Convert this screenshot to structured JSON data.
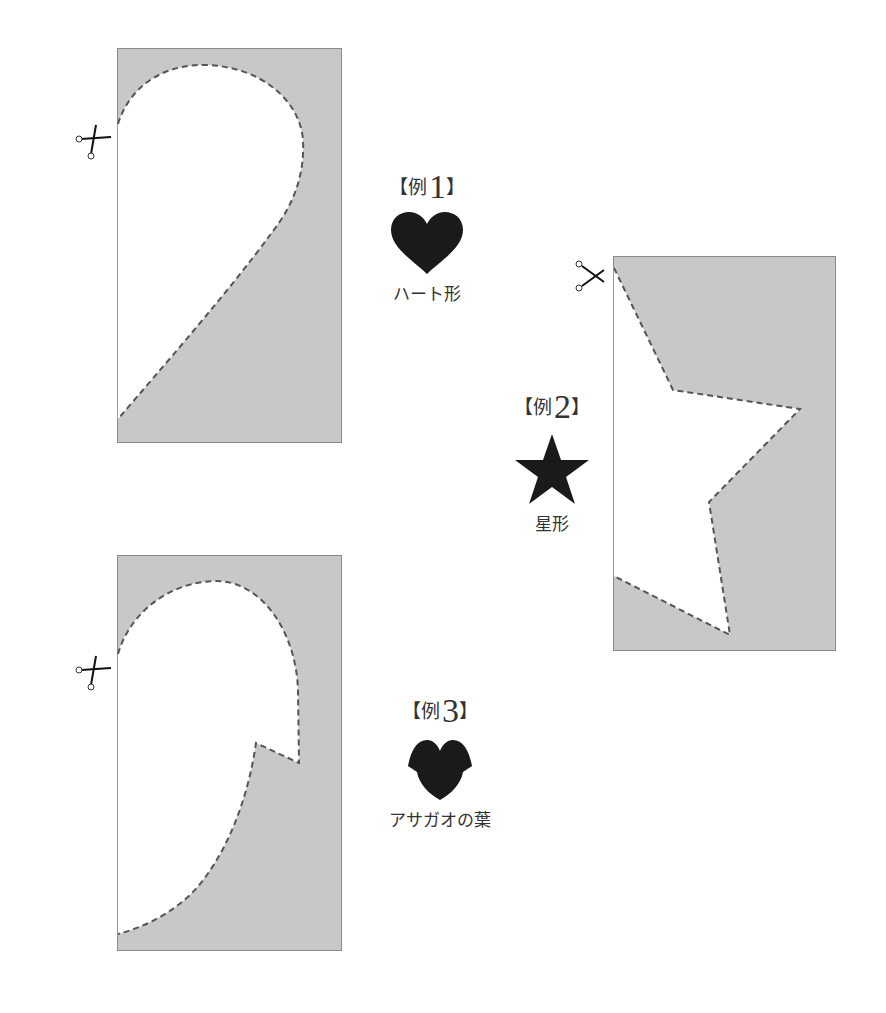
{
  "colors": {
    "paper_fill": "#c8c8c8",
    "paper_border": "#8a8a8a",
    "cut_area": "#ffffff",
    "cut_line": "#555555",
    "icon_fill": "#1a1a1a"
  },
  "examples": [
    {
      "bracket_open": "【",
      "prefix": "例",
      "number": "1",
      "bracket_close": "】",
      "shape_name": "ハート形",
      "icon": "heart-icon"
    },
    {
      "bracket_open": "【",
      "prefix": "例",
      "number": "2",
      "bracket_close": "】",
      "shape_name": "星形",
      "icon": "star-icon"
    },
    {
      "bracket_open": "【",
      "prefix": "例",
      "number": "3",
      "bracket_close": "】",
      "shape_name": "アサガオの葉",
      "icon": "morning-glory-leaf-icon"
    }
  ]
}
